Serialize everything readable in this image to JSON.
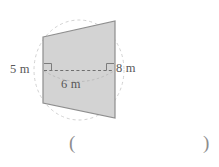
{
  "figure": {
    "shape_name": "trapezoid",
    "fill_color": "#d3d3d3",
    "stroke_color": "#8a8a8a",
    "dash_color": "#6f6f6f",
    "ellipse_color": "#c9c9c9",
    "background_color": "#ffffff",
    "labels": {
      "left_height": "5 m",
      "right_height": "8 m",
      "diameter": "6 m"
    },
    "answer_field": {
      "open_paren": "(",
      "close_paren": ")"
    },
    "markers": {
      "right_angle_left": "right-angle",
      "right_angle_right": "right-angle"
    }
  }
}
